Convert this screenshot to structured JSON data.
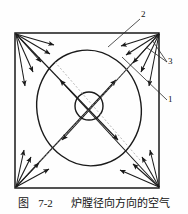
{
  "figure": {
    "caption_prefix": "图",
    "caption_number": "7-2",
    "caption_text": "炉膛径向方向的空气",
    "caption_full": "图 7-2  炉膛径向方向的空气",
    "title_semantic": "furnace-radial-air-flow-diagram"
  },
  "callouts": [
    {
      "id": "2",
      "label": "2",
      "x": 142,
      "y": 11
    },
    {
      "id": "3",
      "label": "3",
      "x": 169,
      "y": 59
    },
    {
      "id": "1",
      "label": "1",
      "x": 169,
      "y": 97
    }
  ],
  "geometry": {
    "square": {
      "x": 14,
      "y": 32,
      "w": 146,
      "h": 157
    },
    "outer_ellipse": {
      "cx": 89,
      "cy": 108,
      "rx": 52,
      "ry": 58,
      "rotation": -12
    },
    "inner_circle": {
      "cx": 89,
      "cy": 106,
      "r": 14
    },
    "corners": [
      {
        "name": "top-left",
        "x": 15,
        "y": 33
      },
      {
        "name": "top-right",
        "x": 159,
        "y": 33
      },
      {
        "name": "bottom-left",
        "x": 15,
        "y": 188
      },
      {
        "name": "bottom-right",
        "x": 159,
        "y": 188
      }
    ]
  },
  "colors": {
    "stroke": "#1a1a1a",
    "text": "#111111",
    "background": "#fefefe",
    "leader": "#2a2a2a"
  },
  "legend_meaning": {
    "1": "wall / furnace boundary callout",
    "2": "air jet stream callout",
    "3": "tangential circle callout"
  }
}
